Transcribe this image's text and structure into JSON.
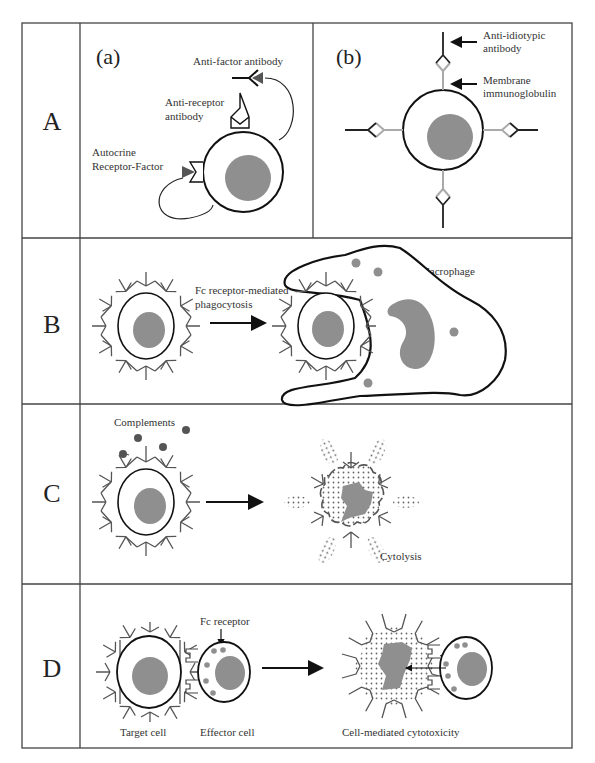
{
  "figure": {
    "panels": [
      {
        "id": "A",
        "label": "A",
        "sub_a": {
          "label": "(a)",
          "anti_factor": "Anti-factor antibody",
          "anti_receptor_1": "Anti-receptor",
          "anti_receptor_2": "antibody",
          "autocrine_1": "Autocrine",
          "autocrine_2": "Receptor-Factor"
        },
        "sub_b": {
          "label": "(b)",
          "anti_idiotypic_1": "Anti-idiotypic",
          "anti_idiotypic_2": "antibody",
          "membrane_1": "Membrane",
          "membrane_2": "immunoglobulin"
        }
      },
      {
        "id": "B",
        "label": "B",
        "process_1": "Fc receptor-mediated",
        "process_2": "phagocytosis",
        "macrophage": "Macrophage"
      },
      {
        "id": "C",
        "label": "C",
        "complements": "Complements",
        "cytolysis": "Cytolysis"
      },
      {
        "id": "D",
        "label": "D",
        "fc_receptor": "Fc receptor",
        "target_cell": "Target cell",
        "effector_cell": "Effector cell",
        "result": "Cell-mediated cytotoxicity"
      }
    ]
  },
  "colors": {
    "nucleus": "#8f8f8f",
    "complement": "#555555",
    "membrane_ig": "#aaaaaa",
    "line": "#111111"
  }
}
